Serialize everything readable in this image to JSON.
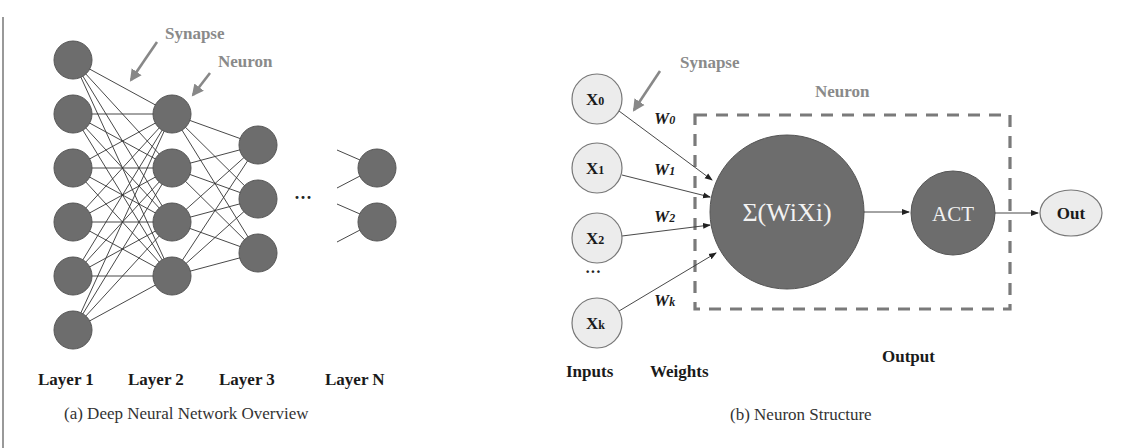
{
  "figure": {
    "left_border_color": "#999999",
    "node_dark_color": "#6d6d6d",
    "node_light_color": "#ececec",
    "annotation_color": "#8a8a8a"
  },
  "panel_a": {
    "caption": "(a) Deep Neural Network Overview",
    "annotations": {
      "synapse": "Synapse",
      "neuron": "Neuron"
    },
    "layers": [
      {
        "label": "Layer 1",
        "nodes": 6
      },
      {
        "label": "Layer 2",
        "nodes": 4
      },
      {
        "label": "Layer 3",
        "nodes": 3
      },
      {
        "label": "Layer N",
        "nodes": 2
      }
    ],
    "ellipsis": "···"
  },
  "panel_b": {
    "caption": "(b) Neuron Structure",
    "annotations": {
      "synapse": "Synapse",
      "neuron": "Neuron"
    },
    "inputs": [
      {
        "label": "X",
        "sub": "0",
        "weight": "W",
        "weight_sub": "0"
      },
      {
        "label": "X",
        "sub": "1",
        "weight": "W",
        "weight_sub": "1"
      },
      {
        "label": "X",
        "sub": "2",
        "weight": "W",
        "weight_sub": "2"
      },
      {
        "label": "X",
        "sub": "k",
        "weight": "W",
        "weight_sub": "k"
      }
    ],
    "input_ellipsis": "···",
    "sum_node": "Σ(WiXi)",
    "activation_node": "ACT",
    "output_node": "Out",
    "column_labels": {
      "inputs": "Inputs",
      "weights": "Weights",
      "output": "Output"
    }
  }
}
